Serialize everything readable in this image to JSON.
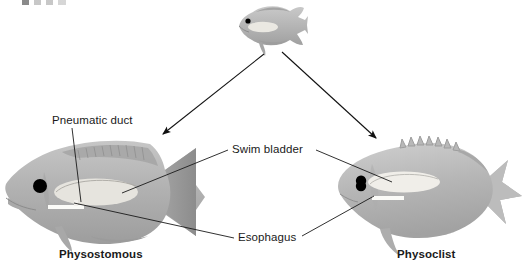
{
  "figure": {
    "type": "labeled-biological-diagram",
    "background_color": "#ffffff"
  },
  "top_fragment": {
    "name": "cropped-header-text-fragment",
    "visible": true
  },
  "labels": {
    "pneumatic_duct": "Pneumatic duct",
    "swim_bladder": "Swim bladder",
    "esophagus": "Esophagus",
    "physostomous": "Physostomous",
    "physoclist": "Physoclist"
  },
  "fishes": [
    {
      "id": "ancestral-fish",
      "name": "ancestral-fish-top",
      "label": "",
      "position": {
        "x": 234,
        "y": 6,
        "width": 74,
        "height": 48
      },
      "body_fill": "#b4b4b4",
      "has_swim_bladder": true,
      "tail": "fan",
      "eye_color": "#000000"
    },
    {
      "id": "physostomous-fish",
      "name": "physostomous-fish-left",
      "label": "Physostomous",
      "position": {
        "x": 4,
        "y": 136,
        "width": 222,
        "height": 106
      },
      "body_fill": "#b0b0b0",
      "has_swim_bladder": true,
      "has_pneumatic_duct": true,
      "tail": "fan",
      "eye_color": "#000000"
    },
    {
      "id": "physoclist-fish",
      "name": "physoclist-fish-right",
      "label": "Physoclist",
      "position": {
        "x": 330,
        "y": 138,
        "width": 196,
        "height": 104
      },
      "body_fill": "#b4b4b4",
      "has_swim_bladder": true,
      "has_pneumatic_duct": false,
      "tail": "forked",
      "eye_color": "#000000"
    }
  ],
  "arrows": [
    {
      "name": "arrow-to-physostomous",
      "from": [
        264,
        54
      ],
      "to": [
        160,
        137
      ]
    },
    {
      "name": "arrow-to-physoclist",
      "from": [
        282,
        52
      ],
      "to": [
        379,
        141
      ]
    }
  ],
  "leader_lines": [
    {
      "name": "leader-pneumatic-duct",
      "from": [
        72,
        128
      ],
      "to": [
        80,
        200
      ]
    },
    {
      "name": "leader-swim-bladder-left",
      "from": [
        230,
        150
      ],
      "to": [
        123,
        193
      ]
    },
    {
      "name": "leader-swim-bladder-right",
      "from": [
        316,
        150
      ],
      "to": [
        390,
        182
      ]
    },
    {
      "name": "leader-esophagus-left",
      "from": [
        236,
        238
      ],
      "to": [
        75,
        204
      ]
    },
    {
      "name": "leader-esophagus-right",
      "from": [
        300,
        236
      ],
      "to": [
        372,
        196
      ]
    }
  ],
  "colors": {
    "line": "#1a1a1a",
    "text": "#1a1a1a",
    "fish_light": "#cfcfcf",
    "fish_mid": "#b4b4b4",
    "fish_dark": "#8f8f8f",
    "bladder": "#eceae4"
  }
}
